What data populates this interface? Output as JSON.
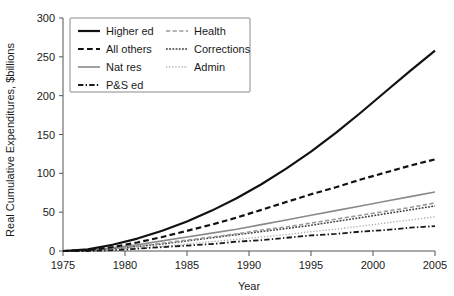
{
  "chart_data": {
    "type": "line",
    "title": "",
    "xlabel": "Year",
    "ylabel": "Real Cumulative Expenditures, $billions",
    "xlim": [
      1975,
      2005
    ],
    "ylim": [
      0,
      300
    ],
    "xticks": [
      1975,
      1980,
      1985,
      1990,
      1995,
      2000,
      2005
    ],
    "yticks": [
      0,
      50,
      100,
      150,
      200,
      250,
      300
    ],
    "grid": false,
    "legend_position": "top-left",
    "x": [
      1975,
      1977,
      1979,
      1981,
      1983,
      1985,
      1987,
      1989,
      1991,
      1993,
      1995,
      1997,
      1999,
      2001,
      2003,
      2005
    ],
    "series": [
      {
        "name": "Higher ed",
        "style": "solid",
        "color": "#111111",
        "width": 2.2,
        "values": [
          0,
          2,
          8,
          16,
          26,
          38,
          52,
          68,
          86,
          106,
          128,
          152,
          178,
          205,
          232,
          258
        ]
      },
      {
        "name": "All others",
        "style": "dashed",
        "color": "#111111",
        "width": 2.2,
        "values": [
          0,
          1,
          5,
          11,
          18,
          26,
          34,
          43,
          53,
          63,
          73,
          82,
          92,
          101,
          110,
          118
        ]
      },
      {
        "name": "Nat res",
        "style": "solid",
        "color": "#8a8a8a",
        "width": 1.6,
        "values": [
          0,
          1,
          4,
          8,
          13,
          18,
          23,
          28,
          34,
          40,
          46,
          52,
          58,
          64,
          70,
          76
        ]
      },
      {
        "name": "Health",
        "style": "dashed",
        "color": "#9a9a9a",
        "width": 1.6,
        "values": [
          0,
          1,
          3,
          6,
          10,
          14,
          18,
          22,
          27,
          31,
          36,
          41,
          46,
          51,
          56,
          62
        ]
      },
      {
        "name": "Corrections",
        "style": "dotted-dense",
        "color": "#3a3a3a",
        "width": 1.5,
        "values": [
          0,
          1,
          3,
          6,
          9,
          13,
          17,
          21,
          25,
          29,
          33,
          38,
          43,
          48,
          53,
          58
        ]
      },
      {
        "name": "Admin",
        "style": "dotted-fine",
        "color": "#b0b0b0",
        "width": 1.4,
        "values": [
          0,
          0,
          2,
          4,
          6,
          9,
          12,
          15,
          18,
          21,
          25,
          28,
          32,
          36,
          40,
          44
        ]
      },
      {
        "name": "P&S ed",
        "style": "dash-dot",
        "color": "#1a1a1a",
        "width": 1.8,
        "values": [
          0,
          0,
          1,
          3,
          5,
          7,
          9,
          12,
          14,
          17,
          20,
          22,
          25,
          27,
          30,
          32
        ]
      }
    ]
  },
  "legend": {
    "entries": [
      {
        "label": "Higher ed",
        "column": 0
      },
      {
        "label": "All others",
        "column": 0
      },
      {
        "label": "Nat res",
        "column": 0
      },
      {
        "label": "P&S ed",
        "column": 0
      },
      {
        "label": "Health",
        "column": 1
      },
      {
        "label": "Corrections",
        "column": 1
      },
      {
        "label": "Admin",
        "column": 1
      }
    ]
  },
  "axes": {
    "y_title": "Real Cumulative Expenditures, $billions",
    "x_title": "Year",
    "y_tick_labels": [
      "0",
      "50",
      "100",
      "150",
      "200",
      "250",
      "300"
    ],
    "x_tick_labels": [
      "1975",
      "1980",
      "1985",
      "1990",
      "1995",
      "2000",
      "2005"
    ]
  }
}
